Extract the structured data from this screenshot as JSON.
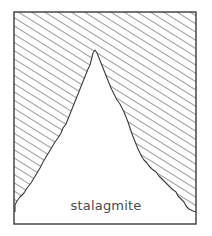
{
  "diagram": {
    "label": "stalagmite",
    "colors": {
      "stroke": "#3a3a3a",
      "hatch": "#4a4a4a",
      "background": "#ffffff",
      "label": "#4a4a4a"
    }
  }
}
